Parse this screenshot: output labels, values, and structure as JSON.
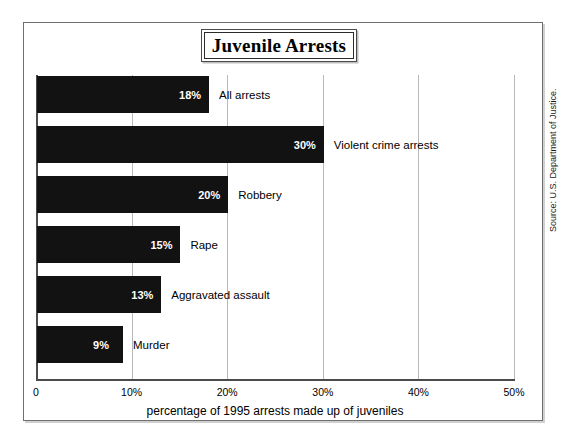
{
  "figure": {
    "title": "Juvenile Arrests",
    "source_note": "Source: U.S. Department of Justice."
  },
  "chart_data": {
    "type": "bar",
    "orientation": "horizontal",
    "title": "Juvenile Arrests",
    "subtitle": "",
    "xlabel": "percentage of 1995 arrests made up of juveniles",
    "ylabel": "",
    "xlim": [
      0,
      50
    ],
    "xtick_labels": [
      "0",
      "10%",
      "20%",
      "30%",
      "40%",
      "50%"
    ],
    "xtick_values": [
      0,
      10,
      20,
      30,
      40,
      50
    ],
    "grid": true,
    "legend": "none",
    "bar_color": "#121212",
    "categories": [
      "All arrests",
      "Violent crime arrests",
      "Robbery",
      "Rape",
      "Aggravated assault",
      "Murder"
    ],
    "values": [
      18,
      30,
      20,
      15,
      13,
      9
    ],
    "value_labels": [
      "18%",
      "30%",
      "20%",
      "15%",
      "13%",
      "9%"
    ],
    "bars": [
      {
        "label": "All arrests",
        "value": 18,
        "value_label": "18%"
      },
      {
        "label": "Violent crime arrests",
        "value": 30,
        "value_label": "30%"
      },
      {
        "label": "Robbery",
        "value": 20,
        "value_label": "20%"
      },
      {
        "label": "Rape",
        "value": 15,
        "value_label": "15%"
      },
      {
        "label": "Aggravated assault",
        "value": 13,
        "value_label": "13%"
      },
      {
        "label": "Murder",
        "value": 9,
        "value_label": "9%"
      }
    ]
  }
}
